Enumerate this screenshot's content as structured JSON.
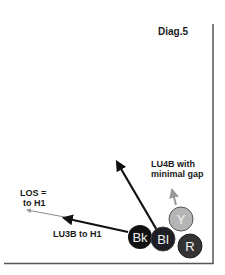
{
  "diagram": {
    "title": "Diag.5",
    "labels": {
      "los_line1": "LOS =",
      "los_line2": "to H1",
      "lu3b": "LU3B to H1",
      "lu4b_line1": "LU4B with",
      "lu4b_line2": "minimal gap"
    },
    "balls": [
      {
        "id": "black",
        "label": "Bk",
        "color": "#111111"
      },
      {
        "id": "blue",
        "label": "Bl",
        "color": "#1e1e24"
      },
      {
        "id": "yellow",
        "label": "Y",
        "color": "#b5b5b5"
      },
      {
        "id": "red",
        "label": "R",
        "color": "#333333"
      }
    ],
    "colors": {
      "frame": "#555555",
      "arrow_dark": "#111111",
      "arrow_gray": "#999999"
    }
  }
}
